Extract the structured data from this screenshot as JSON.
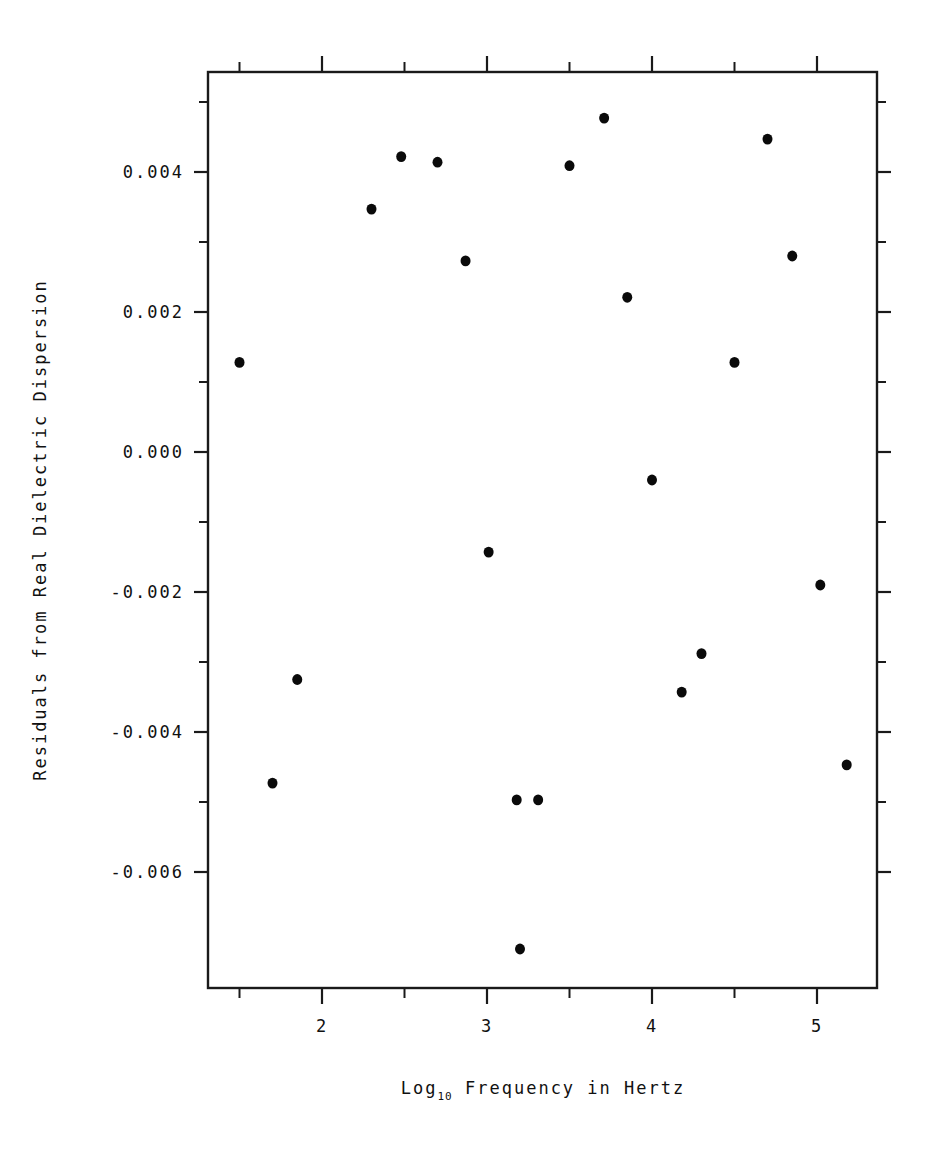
{
  "chart_data": {
    "type": "scatter",
    "title": "",
    "xlabel": "Log10 Frequency in Hertz",
    "xlabel_base": "Log",
    "xlabel_sub": "10",
    "xlabel_rest": " Frequency in Hertz",
    "ylabel": "Residuals from Real Dielectric Dispersion",
    "xlim": [
      1.3,
      5.35
    ],
    "ylim": [
      -0.0078,
      0.00565
    ],
    "xticks": [
      2,
      3,
      4,
      5
    ],
    "xticklabels": [
      "2",
      "3",
      "4",
      "5"
    ],
    "xticks_minor": [
      1.5,
      2.5,
      3.5,
      4.5,
      5.0
    ],
    "yticks": [
      0.004,
      0.002,
      0.0,
      -0.002,
      -0.004,
      -0.006
    ],
    "yticklabels": [
      "0.004",
      "0.002",
      "0.000",
      "-0.002",
      "-0.004",
      "-0.006"
    ],
    "yticks_minor": [
      0.005,
      0.003,
      0.001,
      -0.001,
      -0.003,
      -0.005
    ],
    "grid": false,
    "legend": "none",
    "marker": "filled-circle",
    "marker_color": "#0a0a0a",
    "marker_size_px": 9,
    "n_points": 21,
    "x": [
      1.5,
      1.7,
      1.85,
      2.3,
      2.48,
      2.7,
      2.87,
      3.01,
      3.18,
      3.2,
      3.31,
      3.5,
      3.71,
      3.85,
      4.0,
      4.18,
      4.3,
      4.5,
      4.7,
      4.85,
      5.02,
      5.18
    ],
    "y": [
      0.00128,
      -0.00473,
      -0.00325,
      0.00347,
      0.00422,
      0.00414,
      0.00273,
      -0.00143,
      -0.00497,
      -0.0071,
      -0.00497,
      0.00409,
      0.00477,
      0.00221,
      -0.0004,
      -0.00343,
      -0.00288,
      0.00128,
      0.00447,
      0.0028,
      -0.0019,
      -0.00447
    ],
    "points": [
      {
        "x": 1.5,
        "y": 0.00128
      },
      {
        "x": 1.7,
        "y": -0.00473
      },
      {
        "x": 1.85,
        "y": -0.00325
      },
      {
        "x": 2.3,
        "y": 0.00347
      },
      {
        "x": 2.48,
        "y": 0.00422
      },
      {
        "x": 2.7,
        "y": 0.00414
      },
      {
        "x": 2.87,
        "y": 0.00273
      },
      {
        "x": 3.01,
        "y": -0.00143
      },
      {
        "x": 3.18,
        "y": -0.00497
      },
      {
        "x": 3.2,
        "y": -0.0071
      },
      {
        "x": 3.31,
        "y": -0.00497
      },
      {
        "x": 3.5,
        "y": 0.00409
      },
      {
        "x": 3.71,
        "y": 0.00477
      },
      {
        "x": 3.85,
        "y": 0.00221
      },
      {
        "x": 4.0,
        "y": -0.0004
      },
      {
        "x": 4.18,
        "y": -0.00343
      },
      {
        "x": 4.3,
        "y": -0.00288
      },
      {
        "x": 4.5,
        "y": 0.00128
      },
      {
        "x": 4.7,
        "y": 0.00447
      },
      {
        "x": 4.85,
        "y": 0.0028
      },
      {
        "x": 5.02,
        "y": -0.0019
      },
      {
        "x": 5.18,
        "y": -0.00447
      }
    ]
  },
  "colors": {
    "background": "#ffffff",
    "foreground": "#111111",
    "marker": "#0a0a0a",
    "axis": "#1a1a1a"
  }
}
